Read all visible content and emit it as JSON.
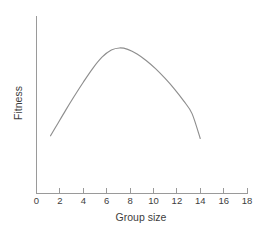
{
  "chart_data": {
    "type": "line",
    "title": "",
    "subtitle": "",
    "xlabel": "Group size",
    "ylabel": "Fitness",
    "xlim": [
      0,
      18
    ],
    "ylim": [
      0,
      1
    ],
    "xticks": [
      0,
      2,
      4,
      6,
      8,
      10,
      12,
      14,
      16,
      18
    ],
    "xtick_labels": [
      "0",
      "2",
      "4",
      "6",
      "8",
      "10",
      "12",
      "14",
      "16",
      "18"
    ],
    "yticks": [],
    "ytick_labels": [],
    "grid": false,
    "legend": false,
    "legend_position": "none",
    "annotations": [],
    "series": [
      {
        "name": "Fitness vs group size",
        "color": "#8e8e8e",
        "style": "solid",
        "x": [
          1.2,
          1.8,
          2.5,
          3.2,
          4.0,
          4.8,
          5.6,
          6.4,
          7.1,
          7.8,
          8.6,
          9.4,
          10.2,
          11.0,
          11.8,
          12.6,
          13.3,
          14.0
        ],
        "y": [
          0.325,
          0.392,
          0.47,
          0.545,
          0.627,
          0.704,
          0.768,
          0.808,
          0.82,
          0.812,
          0.786,
          0.748,
          0.702,
          0.648,
          0.588,
          0.52,
          0.45,
          0.31
        ]
      }
    ]
  },
  "axis": {
    "x_title": "Group size",
    "y_title": "Fitness",
    "tick_0": "0",
    "tick_2": "2",
    "tick_4": "4",
    "tick_6": "6",
    "tick_8": "8",
    "tick_10": "10",
    "tick_12": "12",
    "tick_14": "14",
    "tick_16": "16",
    "tick_18": "18"
  },
  "colors": {
    "curve": "#8e8e8e",
    "axis": "#9a9a9a",
    "text": "#3d3d3d",
    "background": "#ffffff"
  }
}
